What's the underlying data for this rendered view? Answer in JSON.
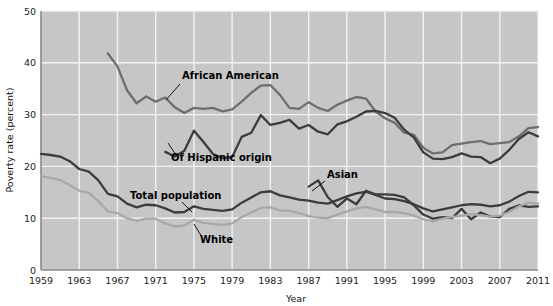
{
  "chart_data": {
    "type": "line",
    "title": "",
    "xlabel": "Year",
    "ylabel": "Poverty rate (percent)",
    "xlim": [
      1959,
      2011
    ],
    "ylim": [
      0,
      50
    ],
    "grid": true,
    "legend": "inline-annotations",
    "xticks": [
      "1959",
      "1963",
      "1967",
      "1971",
      "1975",
      "1979",
      "1983",
      "1987",
      "1991",
      "1995",
      "1999",
      "2003",
      "2007",
      "2011"
    ],
    "yticks": [
      "0",
      "10",
      "20",
      "30",
      "40",
      "50"
    ],
    "plot_background": "#c6c6c6",
    "gridline_color": "#f2f2f2",
    "series": [
      {
        "name": "African American",
        "label": "African American",
        "color": "#6e6e6e",
        "x": [
          1966,
          1967,
          1968,
          1969,
          1970,
          1971,
          1972,
          1973,
          1974,
          1975,
          1976,
          1977,
          1978,
          1979,
          1980,
          1981,
          1982,
          1983,
          1984,
          1985,
          1986,
          1987,
          1988,
          1989,
          1990,
          1991,
          1992,
          1993,
          1994,
          1995,
          1996,
          1997,
          1998,
          1999,
          2000,
          2001,
          2002,
          2003,
          2004,
          2005,
          2006,
          2007,
          2008,
          2009,
          2010,
          2011
        ],
        "values": [
          41.8,
          39.3,
          34.7,
          32.2,
          33.5,
          32.5,
          33.3,
          31.4,
          30.3,
          31.3,
          31.1,
          31.3,
          30.6,
          31.0,
          32.5,
          34.2,
          35.6,
          35.7,
          33.8,
          31.3,
          31.1,
          32.4,
          31.3,
          30.7,
          31.9,
          32.7,
          33.4,
          33.1,
          30.6,
          29.3,
          28.4,
          26.5,
          26.1,
          23.6,
          22.5,
          22.7,
          24.1,
          24.4,
          24.7,
          24.9,
          24.3,
          24.5,
          24.7,
          25.8,
          27.4,
          27.6
        ]
      },
      {
        "name": "Of Hispanic origin",
        "label": "Of Hispanic origin",
        "color": "#3c3c3c",
        "x": [
          1972,
          1973,
          1974,
          1975,
          1976,
          1977,
          1978,
          1979,
          1980,
          1981,
          1982,
          1983,
          1984,
          1985,
          1986,
          1987,
          1988,
          1989,
          1990,
          1991,
          1992,
          1993,
          1994,
          1995,
          1996,
          1997,
          1998,
          1999,
          2000,
          2001,
          2002,
          2003,
          2004,
          2005,
          2006,
          2007,
          2008,
          2009,
          2010,
          2011
        ],
        "values": [
          22.8,
          21.9,
          23.0,
          26.9,
          24.7,
          22.4,
          21.6,
          21.8,
          25.7,
          26.5,
          29.9,
          28.0,
          28.4,
          29.0,
          27.3,
          28.0,
          26.7,
          26.2,
          28.1,
          28.7,
          29.6,
          30.6,
          30.7,
          30.3,
          29.4,
          27.1,
          25.6,
          22.7,
          21.5,
          21.4,
          21.8,
          22.5,
          21.9,
          21.8,
          20.6,
          21.5,
          23.2,
          25.3,
          26.6,
          25.8
        ]
      },
      {
        "name": "Asian",
        "label": "Asian",
        "color": "#3c3c3c",
        "x": [
          1987,
          1988,
          1989,
          1990,
          1991,
          1992,
          1993,
          1994,
          1995,
          1996,
          1997,
          1998,
          1999,
          2000,
          2001,
          2002,
          2003,
          2004,
          2005,
          2006,
          2007,
          2008,
          2009,
          2010,
          2011
        ],
        "values": [
          16.1,
          17.3,
          14.1,
          12.2,
          13.8,
          12.7,
          15.3,
          14.6,
          14.6,
          14.5,
          14.0,
          12.5,
          10.7,
          9.9,
          10.2,
          10.0,
          11.8,
          9.8,
          11.1,
          10.3,
          10.2,
          11.8,
          12.5,
          12.2,
          12.3
        ]
      },
      {
        "name": "Total population",
        "label": "Total population",
        "color": "#3c3c3c",
        "x": [
          1959,
          1960,
          1961,
          1962,
          1963,
          1964,
          1965,
          1966,
          1967,
          1968,
          1969,
          1970,
          1971,
          1972,
          1973,
          1974,
          1975,
          1976,
          1977,
          1978,
          1979,
          1980,
          1981,
          1982,
          1983,
          1984,
          1985,
          1986,
          1987,
          1988,
          1989,
          1990,
          1991,
          1992,
          1993,
          1994,
          1995,
          1996,
          1997,
          1998,
          1999,
          2000,
          2001,
          2002,
          2003,
          2004,
          2005,
          2006,
          2007,
          2008,
          2009,
          2010,
          2011
        ],
        "values": [
          22.4,
          22.2,
          21.9,
          21.0,
          19.5,
          19.0,
          17.3,
          14.7,
          14.2,
          12.8,
          12.1,
          12.6,
          12.5,
          11.9,
          11.1,
          11.2,
          12.3,
          11.8,
          11.6,
          11.4,
          11.7,
          13.0,
          14.0,
          15.0,
          15.2,
          14.4,
          14.0,
          13.6,
          13.4,
          13.0,
          12.8,
          13.5,
          14.2,
          14.8,
          15.1,
          14.5,
          13.8,
          13.7,
          13.3,
          12.7,
          11.9,
          11.3,
          11.7,
          12.1,
          12.5,
          12.7,
          12.6,
          12.3,
          12.5,
          13.2,
          14.3,
          15.1,
          15.0
        ]
      },
      {
        "name": "White",
        "label": "White",
        "color": "#a8a8a8",
        "x": [
          1959,
          1960,
          1961,
          1962,
          1963,
          1964,
          1965,
          1966,
          1967,
          1968,
          1969,
          1970,
          1971,
          1972,
          1973,
          1974,
          1975,
          1976,
          1977,
          1978,
          1979,
          1980,
          1981,
          1982,
          1983,
          1984,
          1985,
          1986,
          1987,
          1988,
          1989,
          1990,
          1991,
          1992,
          1993,
          1994,
          1995,
          1996,
          1997,
          1998,
          1999,
          2000,
          2001,
          2002,
          2003,
          2004,
          2005,
          2006,
          2007,
          2008,
          2009,
          2010,
          2011
        ],
        "values": [
          18.1,
          17.8,
          17.4,
          16.4,
          15.3,
          14.9,
          13.3,
          11.3,
          11.0,
          10.0,
          9.5,
          9.9,
          9.9,
          9.0,
          8.4,
          8.6,
          9.7,
          9.1,
          8.9,
          8.7,
          9.0,
          10.2,
          11.1,
          12.0,
          12.1,
          11.5,
          11.4,
          11.0,
          10.4,
          10.1,
          10.0,
          10.7,
          11.3,
          11.9,
          12.2,
          11.7,
          11.2,
          11.2,
          11.0,
          10.5,
          9.8,
          9.4,
          9.9,
          10.2,
          10.5,
          10.8,
          10.6,
          10.3,
          10.5,
          11.2,
          12.3,
          13.0,
          12.8
        ]
      }
    ],
    "annotations": [
      {
        "text": "African American",
        "x_px": 182,
        "y_px": 79,
        "leader": [
          [
            180,
            84
          ],
          [
            166,
            100
          ]
        ]
      },
      {
        "text": "Of Hispanic origin",
        "x_px": 171,
        "y_px": 161,
        "leader": [
          [
            176,
            155
          ],
          [
            168,
            143
          ]
        ]
      },
      {
        "text": "Total population",
        "x_px": 130,
        "y_px": 199,
        "leader": [
          [
            182,
            202
          ],
          [
            192,
            212
          ]
        ]
      },
      {
        "text": "White",
        "x_px": 200,
        "y_px": 243,
        "leader": [
          [
            202,
            237
          ],
          [
            194,
            224
          ]
        ]
      },
      {
        "text": "Asian",
        "x_px": 327,
        "y_px": 178,
        "leader": [
          [
            325,
            181
          ],
          [
            312,
            191
          ]
        ]
      }
    ]
  }
}
